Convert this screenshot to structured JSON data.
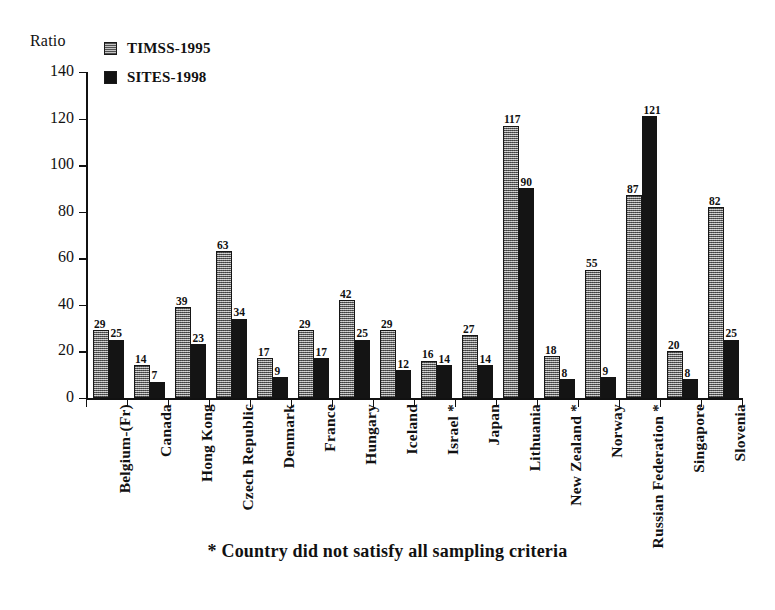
{
  "chart_data": {
    "type": "bar",
    "title": "",
    "subtitle": "",
    "xlabel": "",
    "ylabel": "Ratio",
    "ylim": [
      0,
      140
    ],
    "ytick_step": 20,
    "grid": false,
    "legend_position": "top-left",
    "yticks": [
      0,
      20,
      40,
      60,
      80,
      100,
      120,
      140
    ],
    "categories": [
      "Belgium-(Fr)",
      "Canada",
      "Hong Kong",
      "Czech Republic",
      "Denmark",
      "France",
      "Hungary",
      "Iceland",
      "Israel *",
      "Japan",
      "Lithuania",
      "New Zealand *",
      "Norway",
      "Russian Federation *",
      "Singapore",
      "Slovenia"
    ],
    "series": [
      {
        "name": "TIMSS-1995",
        "color": "#8d8d8d",
        "values": [
          29,
          14,
          39,
          63,
          17,
          29,
          42,
          29,
          16,
          27,
          117,
          18,
          55,
          87,
          20,
          82
        ]
      },
      {
        "name": "SITES-1998",
        "color": "#141414",
        "values": [
          25,
          7,
          23,
          34,
          9,
          17,
          25,
          12,
          14,
          14,
          90,
          8,
          9,
          121,
          8,
          25
        ]
      }
    ],
    "annotations": [
      "* Country did not satisfy all sampling criteria"
    ]
  },
  "legend": {
    "items": [
      {
        "label": "TIMSS-1995",
        "swatch": "timss-swatch-icon"
      },
      {
        "label": "SITES-1998",
        "swatch": "sites-swatch-icon"
      }
    ]
  },
  "axis": {
    "y_title": "Ratio"
  },
  "footnote": {
    "text": "* Country did not satisfy all sampling criteria"
  }
}
